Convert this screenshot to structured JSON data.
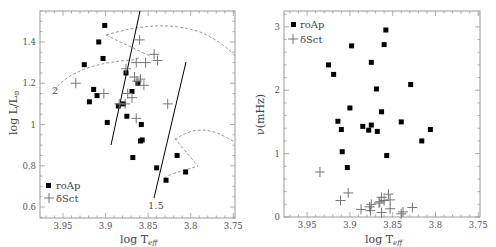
{
  "chart_data": [
    {
      "type": "scatter",
      "title": "",
      "xlabel": "log T_eff",
      "ylabel": "log L/L_sun",
      "xlim": [
        3.977,
        3.748
      ],
      "ylim": [
        0.547,
        1.55
      ],
      "xticks": [
        3.95,
        3.9,
        3.85,
        3.8,
        3.75
      ],
      "xtick_labels": [
        "3.95",
        "3.9",
        "3.85",
        "3.8",
        "3.75"
      ],
      "yticks": [
        0.6,
        0.8,
        1.0,
        1.2,
        1.4
      ],
      "ytick_labels": [
        "0.6",
        "0.8",
        "1",
        "1.2",
        "1.4"
      ],
      "legend": {
        "position": "lower left",
        "entries": [
          "roAp",
          "δSct"
        ]
      },
      "series": [
        {
          "name": "roAp",
          "marker": "square",
          "points": [
            [
              3.901,
              1.48
            ],
            [
              3.908,
              1.4
            ],
            [
              3.903,
              1.32
            ],
            [
              3.925,
              1.29
            ],
            [
              3.876,
              1.25
            ],
            [
              3.914,
              1.17
            ],
            [
              3.91,
              1.14
            ],
            [
              3.919,
              1.11
            ],
            [
              3.869,
              1.16
            ],
            [
              3.862,
              1.2
            ],
            [
              3.879,
              1.1
            ],
            [
              3.885,
              1.09
            ],
            [
              3.898,
              1.01
            ],
            [
              3.875,
              1.04
            ],
            [
              3.858,
              1.0
            ],
            [
              3.859,
              0.92
            ],
            [
              3.857,
              0.925
            ],
            [
              3.868,
              0.84
            ],
            [
              3.84,
              0.79
            ],
            [
              3.816,
              0.85
            ],
            [
              3.829,
              0.73
            ],
            [
              3.806,
              0.77
            ]
          ]
        },
        {
          "name": "δSct",
          "marker": "plus",
          "points": [
            [
              3.935,
              1.2
            ],
            [
              3.902,
              1.15
            ],
            [
              3.876,
              1.27
            ],
            [
              3.864,
              1.3
            ],
            [
              3.86,
              1.41
            ],
            [
              3.853,
              1.3
            ],
            [
              3.843,
              1.34
            ],
            [
              3.839,
              1.31
            ],
            [
              3.866,
              1.23
            ],
            [
              3.863,
              1.21
            ],
            [
              3.859,
              1.22
            ],
            [
              3.855,
              1.19
            ],
            [
              3.874,
              1.15
            ],
            [
              3.869,
              1.13
            ],
            [
              3.877,
              1.1
            ],
            [
              3.884,
              1.1
            ],
            [
              3.864,
              1.03
            ],
            [
              3.827,
              1.1
            ]
          ]
        }
      ],
      "tracks": [
        {
          "label": "2",
          "type": "evolutionary track (dashed)"
        },
        {
          "label": "1.5",
          "type": "evolutionary track (dashed)"
        }
      ],
      "instability_strip": "two solid lines"
    },
    {
      "type": "scatter",
      "title": "",
      "xlabel": "log T_eff",
      "ylabel": "ν(mHz)",
      "xlim": [
        3.977,
        3.748
      ],
      "ylim": [
        0,
        3.25
      ],
      "xticks": [
        3.95,
        3.9,
        3.85,
        3.8,
        3.75
      ],
      "xtick_labels": [
        "3.95",
        "3.9",
        "3.85",
        "3.8",
        "3.75"
      ],
      "yticks": [
        0,
        1,
        2,
        3
      ],
      "ytick_labels": [
        "0",
        "1",
        "2",
        "3"
      ],
      "legend": {
        "position": "upper left",
        "entries": [
          "roAp",
          "δSct"
        ]
      },
      "series": [
        {
          "name": "roAp",
          "marker": "square",
          "points": [
            [
              3.858,
              2.95
            ],
            [
              3.86,
              2.72
            ],
            [
              3.898,
              2.7
            ],
            [
              3.875,
              2.44
            ],
            [
              3.925,
              2.4
            ],
            [
              3.919,
              2.25
            ],
            [
              3.869,
              2.02
            ],
            [
              3.829,
              2.09
            ],
            [
              3.9,
              1.72
            ],
            [
              3.863,
              1.66
            ],
            [
              3.914,
              1.51
            ],
            [
              3.91,
              1.38
            ],
            [
              3.885,
              1.43
            ],
            [
              3.875,
              1.45
            ],
            [
              3.878,
              1.37
            ],
            [
              3.868,
              1.35
            ],
            [
              3.84,
              1.5
            ],
            [
              3.806,
              1.38
            ],
            [
              3.816,
              1.2
            ],
            [
              3.909,
              1.03
            ],
            [
              3.857,
              0.97
            ],
            [
              3.903,
              0.78
            ]
          ]
        },
        {
          "name": "δSct",
          "marker": "plus",
          "points": [
            [
              3.935,
              0.71
            ],
            [
              3.902,
              0.38
            ],
            [
              3.911,
              0.26
            ],
            [
              3.855,
              0.36
            ],
            [
              3.853,
              0.27
            ],
            [
              3.863,
              0.31
            ],
            [
              3.86,
              0.26
            ],
            [
              3.866,
              0.22
            ],
            [
              3.875,
              0.2
            ],
            [
              3.877,
              0.16
            ],
            [
              3.876,
              0.1
            ],
            [
              3.887,
              0.12
            ],
            [
              3.863,
              0.07
            ],
            [
              3.853,
              0.13
            ],
            [
              3.84,
              0.05
            ],
            [
              3.838,
              0.08
            ],
            [
              3.827,
              0.15
            ],
            [
              3.865,
              0.24
            ]
          ]
        }
      ]
    }
  ],
  "left": {
    "xlabel": "log T",
    "xlabel_sub": "eff",
    "ylabel": "log L/L",
    "ylabel_sub": "⊙",
    "legend": [
      "roAp",
      "δSct"
    ],
    "track_labels": [
      "2",
      "1.5"
    ]
  },
  "right": {
    "xlabel": "log T",
    "xlabel_sub": "eff",
    "ylabel": "ν(mHz)",
    "legend": [
      "roAp",
      "δSct"
    ]
  }
}
